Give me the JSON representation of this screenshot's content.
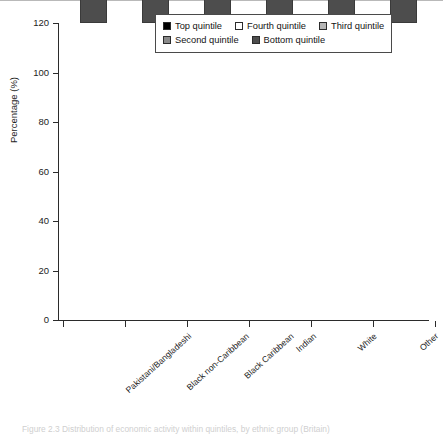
{
  "figure": {
    "y_axis_title": "Percentage (%)",
    "caption": "Figure 2.3  Distribution of economic activity within quintiles, by ethnic group (Britain)"
  },
  "legend": {
    "rows": [
      [
        {
          "label": "Top quintile",
          "color": "#000000"
        },
        {
          "label": "Fourth quintile",
          "color": "#ffffff"
        },
        {
          "label": "Third quintile",
          "color": "#b5b5b5"
        }
      ],
      [
        {
          "label": "Second quintile",
          "color": "#8a8a8a"
        },
        {
          "label": "Bottom quintile",
          "color": "#4d4d4d"
        }
      ]
    ]
  },
  "chart_data": {
    "type": "bar",
    "subtype": "stacked-vertical",
    "title": "",
    "xlabel": "",
    "ylabel": "Percentage (%)",
    "ylim": [
      0,
      120
    ],
    "yticks": [
      0,
      20,
      40,
      60,
      80,
      100,
      120
    ],
    "grid": false,
    "legend_position": "top-right-inside",
    "categories": [
      "Pakistani/Bangladeshi",
      "Black non-Caribbean",
      "Black Caribbean",
      "Indian",
      "White",
      "Other"
    ],
    "series": [
      {
        "name": "Bottom quintile",
        "color": "#4d4d4d",
        "values": [
          60,
          46,
          27,
          26,
          18,
          34
        ]
      },
      {
        "name": "Second quintile",
        "color": "#8a8a8a",
        "values": [
          24,
          16,
          22,
          23,
          20,
          18
        ]
      },
      {
        "name": "Third quintile",
        "color": "#b5b5b5",
        "values": [
          9.5,
          11.5,
          18,
          19,
          21,
          12
        ]
      },
      {
        "name": "Fourth quintile",
        "color": "#ffffff",
        "values": [
          2.5,
          11.5,
          17,
          14,
          21,
          14
        ]
      },
      {
        "name": "Top quintile",
        "color": "#000000",
        "values": [
          4,
          14,
          16,
          18,
          20,
          22
        ]
      }
    ],
    "totals": [
      100,
      99,
      100,
      100,
      100,
      100
    ]
  }
}
